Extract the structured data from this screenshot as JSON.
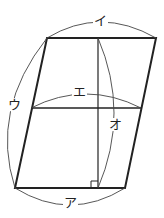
{
  "diagram": {
    "shape": "parallelogram",
    "labels": {
      "a": "ア",
      "i": "イ",
      "u": "ウ",
      "e": "エ",
      "o": "オ"
    },
    "colors": {
      "line": "#222222",
      "arc": "#444444"
    }
  }
}
